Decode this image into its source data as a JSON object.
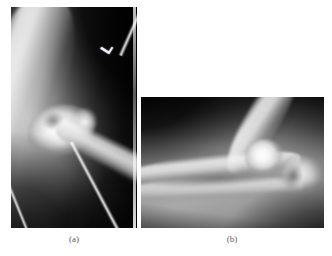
{
  "figure": {
    "background_color": "#ffffff",
    "width": 332,
    "height": 256,
    "modality": "X-ray radiograph",
    "body_part": "elbow"
  },
  "panels": [
    {
      "id": "a",
      "caption": "(a)",
      "view": "anteroposterior",
      "orientation": "portrait",
      "side_marker": "L",
      "marker_type": "radiopaque-lead-side-marker",
      "background_color": "#0a0a0a",
      "bone_color": "#ffffff",
      "structures": [
        "humerus shaft",
        "distal humerus condyle",
        "olecranon fossa",
        "radial head",
        "ulna shaft",
        "radius shaft"
      ]
    },
    {
      "id": "b",
      "caption": "(b)",
      "view": "lateral",
      "orientation": "landscape",
      "side_marker": "",
      "background_color": "#0d0d0d",
      "bone_color": "#ffffff",
      "structures": [
        "humerus shaft",
        "capitellum",
        "olecranon",
        "trochlear notch",
        "ulna shaft",
        "radius shaft"
      ]
    }
  ]
}
